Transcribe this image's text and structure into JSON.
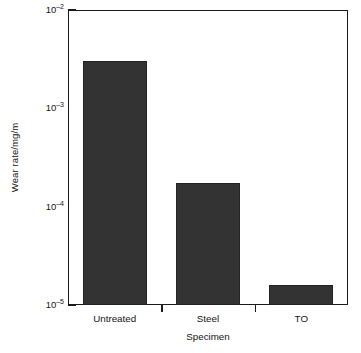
{
  "chart_data": {
    "type": "bar",
    "title": "",
    "xlabel": "Specimen",
    "ylabel": "Wear rate/mg/m",
    "categories": [
      "Untreated",
      "Steel",
      "TO"
    ],
    "values": [
      0.003,
      0.000175,
      1.6e-05
    ],
    "yscale": "log",
    "ylim": [
      1e-05,
      0.01
    ],
    "grid": false,
    "legend": null,
    "bar_color": "#333333",
    "y_major_ticks": [
      {
        "value": 0.01,
        "label_mantissa": "10",
        "label_exponent": "–2"
      },
      {
        "value": 0.001,
        "label_mantissa": "10",
        "label_exponent": "–3"
      },
      {
        "value": 0.0001,
        "label_mantissa": "10",
        "label_exponent": "–4"
      },
      {
        "value": 1e-05,
        "label_mantissa": "10",
        "label_exponent": "–5"
      }
    ],
    "y_tick_labels": [
      "10–2",
      "10–3",
      "10–4",
      "10–5"
    ],
    "series": [
      {
        "name": "Wear rate",
        "points": [
          {
            "category": "Untreated",
            "value": 0.003
          },
          {
            "category": "Steel",
            "value": 0.000175
          },
          {
            "category": "TO",
            "value": 1.6e-05
          }
        ]
      }
    ]
  },
  "axes": {
    "y_title": "Wear rate/mg/m",
    "x_title": "Specimen",
    "y_labels": [
      {
        "mantissa": "10",
        "exponent": "–2"
      },
      {
        "mantissa": "10",
        "exponent": "–3"
      },
      {
        "mantissa": "10",
        "exponent": "–4"
      },
      {
        "mantissa": "10",
        "exponent": "–5"
      }
    ],
    "x_labels": [
      "Untreated",
      "Steel",
      "TO"
    ]
  },
  "colors": {
    "bar": "#333333",
    "bar_edge": "#232323",
    "axis": "#1b1b1b",
    "text": "#141414",
    "background": "#ffffff"
  }
}
